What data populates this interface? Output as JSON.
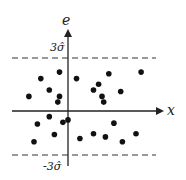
{
  "chart_data": {
    "type": "scatter",
    "title": "",
    "xlabel": "x",
    "ylabel": "e",
    "bands": [
      {
        "label": "3σ̂",
        "value": 3
      },
      {
        "label": "-3σ̂",
        "value": -3
      }
    ],
    "xlim": [
      -3,
      5.5
    ],
    "ylim": [
      -3.6,
      5
    ],
    "points": [
      {
        "x": -1.6,
        "y": 2.0
      },
      {
        "x": -0.5,
        "y": 2.4
      },
      {
        "x": 0.5,
        "y": 2.0
      },
      {
        "x": -1.1,
        "y": 1.3
      },
      {
        "x": -2.3,
        "y": 0.9
      },
      {
        "x": -0.5,
        "y": 0.9
      },
      {
        "x": -0.6,
        "y": 0.55
      },
      {
        "x": 2.4,
        "y": 2.3
      },
      {
        "x": 4.3,
        "y": 2.4
      },
      {
        "x": 1.8,
        "y": 1.65
      },
      {
        "x": 1.5,
        "y": 1.3
      },
      {
        "x": 3.1,
        "y": 1.2
      },
      {
        "x": 2.0,
        "y": 0.9
      },
      {
        "x": 2.1,
        "y": 0.55
      },
      {
        "x": -1.1,
        "y": -0.35
      },
      {
        "x": -1.8,
        "y": -0.8
      },
      {
        "x": -0.3,
        "y": -0.7
      },
      {
        "x": 0.0,
        "y": -0.55
      },
      {
        "x": 2.7,
        "y": -0.75
      },
      {
        "x": -0.8,
        "y": -1.45
      },
      {
        "x": -2.0,
        "y": -1.9
      },
      {
        "x": 1.5,
        "y": -1.4
      },
      {
        "x": 0.7,
        "y": -1.7
      },
      {
        "x": 2.2,
        "y": -1.6
      },
      {
        "x": 3.2,
        "y": -1.9
      },
      {
        "x": 4.0,
        "y": -1.4
      }
    ]
  },
  "labels": {
    "y_axis": "e",
    "x_axis": "x",
    "upper": "3σ̂",
    "lower": "-3σ̂"
  }
}
